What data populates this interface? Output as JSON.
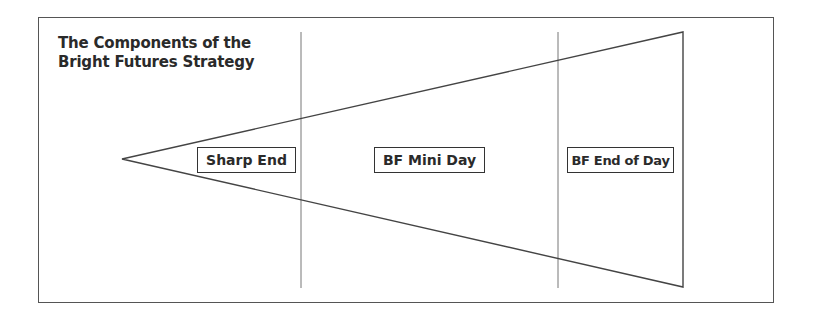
{
  "diagram": {
    "title_line1": "The Components of the",
    "title_line2": "Bright Futures Strategy",
    "segments": [
      {
        "label": "Sharp End"
      },
      {
        "label": "BF Mini Day"
      },
      {
        "label": "BF End of Day"
      }
    ],
    "shape": "wedge-triangle",
    "colors": {
      "stroke": "#555555",
      "text": "#2a2a2a",
      "background": "#ffffff"
    }
  }
}
